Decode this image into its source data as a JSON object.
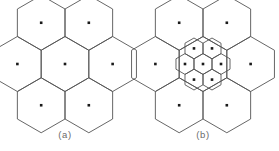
{
  "figure": {
    "background_color": "#ffffff",
    "line_color": "#555555",
    "line_width": 0.9,
    "marker_color": "#1a1a1a",
    "marker_size": 2.6,
    "caption_color": "#6b6b6b",
    "width": 279,
    "height": 151
  },
  "panels": [
    {
      "id": "panel-a",
      "caption": "(a)",
      "caption_x": 65,
      "caption_y": 129,
      "center_x": 65,
      "center_y": 64,
      "cell_radius": 27.5,
      "orientation": "pointy-top",
      "cells": [
        {
          "name": "center",
          "q": 0,
          "r": 0,
          "dot": true
        },
        {
          "name": "top",
          "q": 0,
          "r": -1,
          "dot": true
        },
        {
          "name": "upper-right",
          "q": 1,
          "r": -1,
          "dot": true
        },
        {
          "name": "lower-right",
          "q": 1,
          "r": 0,
          "dot": true
        },
        {
          "name": "bottom",
          "q": 0,
          "r": 1,
          "dot": true
        },
        {
          "name": "lower-left",
          "q": -1,
          "r": 1,
          "dot": true
        },
        {
          "name": "upper-left",
          "q": -1,
          "r": 0,
          "dot": true
        }
      ],
      "inner_cluster": null
    },
    {
      "id": "panel-b",
      "caption": "(b)",
      "caption_x": 203,
      "caption_y": 129,
      "center_x": 203,
      "center_y": 64,
      "cell_radius": 27.5,
      "orientation": "pointy-top",
      "cells": [
        {
          "name": "center",
          "q": 0,
          "r": 0,
          "dot": false
        },
        {
          "name": "top",
          "q": 0,
          "r": -1,
          "dot": true
        },
        {
          "name": "upper-right",
          "q": 1,
          "r": -1,
          "dot": true
        },
        {
          "name": "lower-right",
          "q": 1,
          "r": 0,
          "dot": true
        },
        {
          "name": "bottom",
          "q": 0,
          "r": 1,
          "dot": true
        },
        {
          "name": "lower-left",
          "q": -1,
          "r": 1,
          "dot": true
        },
        {
          "name": "upper-left",
          "q": -1,
          "r": 0,
          "dot": true
        }
      ],
      "inner_cluster": {
        "name": "inner-small-cell-cluster",
        "center_x": 203,
        "center_y": 64,
        "cell_radius": 10.4,
        "orientation": "pointy-top",
        "cells": [
          {
            "name": "center",
            "q": 0,
            "r": 0,
            "dot": true
          },
          {
            "name": "top",
            "q": 0,
            "r": -1,
            "dot": true
          },
          {
            "name": "upper-right",
            "q": 1,
            "r": -1,
            "dot": true
          },
          {
            "name": "lower-right",
            "q": 1,
            "r": 0,
            "dot": true
          },
          {
            "name": "bottom",
            "q": 0,
            "r": 1,
            "dot": true
          },
          {
            "name": "lower-left",
            "q": -1,
            "r": 1,
            "dot": true
          },
          {
            "name": "upper-left",
            "q": -1,
            "r": 0,
            "dot": true
          }
        ]
      }
    }
  ]
}
